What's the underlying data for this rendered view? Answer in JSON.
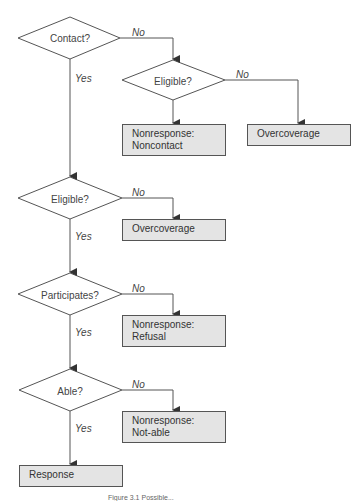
{
  "diagram": {
    "type": "flowchart",
    "decisions": [
      {
        "id": "contact",
        "label": "Contact?"
      },
      {
        "id": "eligible_noncontact",
        "label": "Eligible?"
      },
      {
        "id": "eligible",
        "label": "Eligible?"
      },
      {
        "id": "participates",
        "label": "Participates?"
      },
      {
        "id": "able",
        "label": "Able?"
      }
    ],
    "outcomes": [
      {
        "id": "nonresponse_noncontact",
        "line1": "Nonresponse:",
        "line2": "Noncontact"
      },
      {
        "id": "overcoverage_1",
        "line1": "Overcoverage"
      },
      {
        "id": "overcoverage_2",
        "line1": "Overcoverage"
      },
      {
        "id": "nonresponse_refusal",
        "line1": "Nonresponse:",
        "line2": "Refusal"
      },
      {
        "id": "nonresponse_notable",
        "line1": "Nonresponse:",
        "line2": "Not-able"
      },
      {
        "id": "response",
        "line1": "Response"
      }
    ],
    "edge_labels": {
      "yes": "Yes",
      "no": "No"
    },
    "edges": [
      {
        "from": "contact",
        "to": "eligible_noncontact",
        "label": "No"
      },
      {
        "from": "contact",
        "to": "eligible",
        "label": "Yes"
      },
      {
        "from": "eligible_noncontact",
        "to": "overcoverage_1",
        "label": "No"
      },
      {
        "from": "eligible_noncontact",
        "to": "nonresponse_noncontact",
        "label": ""
      },
      {
        "from": "eligible",
        "to": "overcoverage_2",
        "label": "No"
      },
      {
        "from": "eligible",
        "to": "participates",
        "label": "Yes"
      },
      {
        "from": "participates",
        "to": "nonresponse_refusal",
        "label": "No"
      },
      {
        "from": "participates",
        "to": "able",
        "label": "Yes"
      },
      {
        "from": "able",
        "to": "nonresponse_notable",
        "label": "No"
      },
      {
        "from": "able",
        "to": "response",
        "label": "Yes"
      }
    ],
    "colors": {
      "box_fill": "#e4e4e4",
      "stroke": "#444444"
    },
    "caption": "Figure 3.1 Possible..."
  }
}
